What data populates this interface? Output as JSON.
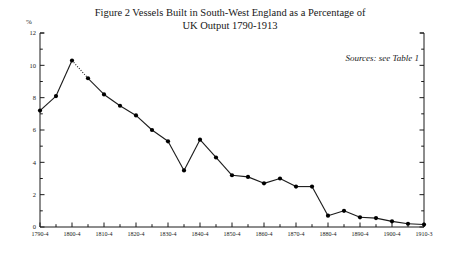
{
  "figure": {
    "title_line1": "Figure 2   Vessels Built in South-West England as a Percentage of",
    "title_line2": "UK Output 1790-1913",
    "y_unit_label": "%",
    "sources_note": "Sources: see Table 1"
  },
  "chart_data": {
    "type": "line",
    "title": "Figure 2   Vessels Built in South-West England as a Percentage of UK Output 1790-1913",
    "xlabel": "",
    "ylabel": "%",
    "ylim": [
      0,
      12
    ],
    "ytick_values": [
      0,
      2,
      4,
      6,
      8,
      10,
      12
    ],
    "ytick_labels": [
      "0",
      "2",
      "4",
      "6",
      "8",
      "10",
      "12"
    ],
    "y_minor_tick_step": 1,
    "grid": false,
    "legend": "none",
    "marker": "filled-circle",
    "annotation": "Sources: see Table 1",
    "categories": [
      "1790-4",
      "1795-9",
      "1800-4",
      "1805-9",
      "1810-4",
      "1815-9",
      "1820-4",
      "1825-9",
      "1830-4",
      "1835-9",
      "1840-4",
      "1845-9",
      "1850-4",
      "1855-9",
      "1860-4",
      "1865-9",
      "1870-4",
      "1875-9",
      "1880-4",
      "1885-9",
      "1890-4",
      "1895-9",
      "1900-4",
      "1905-9",
      "1910-3"
    ],
    "xtick_labels_shown": [
      "1790-4",
      "1800-4",
      "1810-4",
      "1820-4",
      "1830-4",
      "1840-4",
      "1850-4",
      "1860-4",
      "1870-4",
      "1880-4",
      "1890-4",
      "1900-4",
      "1910-3"
    ],
    "values": [
      7.2,
      8.1,
      10.3,
      9.2,
      8.2,
      7.5,
      6.9,
      6.0,
      5.3,
      3.5,
      5.4,
      4.3,
      3.2,
      3.1,
      2.7,
      3.0,
      2.5,
      2.5,
      0.7,
      1.0,
      0.6,
      0.55,
      0.35,
      0.2,
      0.15
    ],
    "dotted_segments": [
      [
        2,
        3
      ]
    ],
    "colors": {
      "line": "#1a1a1a",
      "marker": "#000000",
      "axis": "#1a1a1a",
      "background": "#ffffff"
    }
  }
}
